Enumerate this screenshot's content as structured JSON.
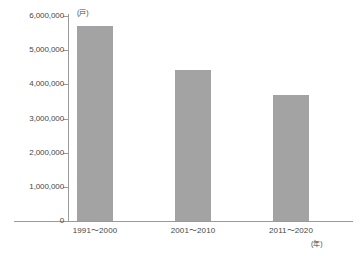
{
  "chart_data": {
    "type": "bar",
    "title": "",
    "xlabel": "年",
    "ylabel": "戸",
    "y_unit_label": "(戸)",
    "x_unit_label": "(年)",
    "categories": [
      "1991〜2000",
      "2001〜2010",
      "2011〜2020"
    ],
    "values": [
      5700000,
      4430000,
      3680000
    ],
    "series": [
      {
        "name": "住宅着工戸数",
        "values": [
          5700000,
          4430000,
          3680000
        ]
      }
    ],
    "ylim": [
      0,
      6000000
    ],
    "ytick_values": [
      6000000,
      5000000,
      4000000,
      3000000,
      2000000,
      1000000,
      0
    ],
    "ytick_labels": [
      "6,000,000",
      "5,000,000",
      "4,000,000",
      "3,000,000",
      "2,000,000",
      "1,000,000",
      "0"
    ],
    "grid": false,
    "legend": false,
    "legend_position": "none",
    "bar_color": "#a3a3a3",
    "axis_color": "#9a9a9a",
    "text_color": "#464646",
    "background_color": "#ffffff"
  }
}
